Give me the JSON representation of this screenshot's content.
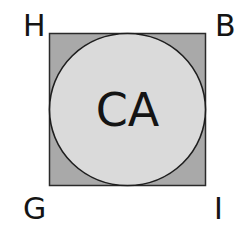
{
  "diagram": {
    "type": "inscribed-circle-in-square",
    "center_label": "CA",
    "corners": {
      "top_left": "H",
      "top_right": "B",
      "bottom_left": "G",
      "bottom_right": "I"
    },
    "colors": {
      "square_fill": "#a9a9a9",
      "circle_fill": "#dadada",
      "stroke": "#2a2a2a",
      "text": "#141414"
    }
  }
}
